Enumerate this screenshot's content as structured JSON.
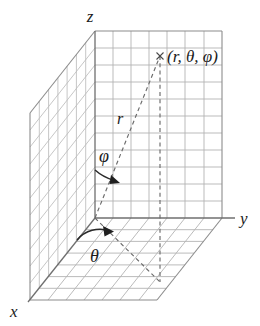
{
  "figure": {
    "background_color": "#ffffff",
    "grid_color": "#b3b3b3",
    "frame_color": "#8c8c8c",
    "axis_color": "#6f6f6f",
    "dashed_color": "#6b6b6b",
    "label_color": "#1b1b1b"
  },
  "axes": [
    {
      "key": "z",
      "label": "z",
      "name": "z-axis-label"
    },
    {
      "key": "y",
      "label": "y",
      "name": "y-axis-label"
    },
    {
      "key": "x",
      "label": "x",
      "name": "x-axis-label"
    }
  ],
  "labels": {
    "z": "z",
    "y": "y",
    "x": "x",
    "radius": "r",
    "polar_angle": "φ",
    "azimuth_angle": "θ",
    "point": "(r, θ, φ)"
  },
  "point": {
    "marker": "×",
    "coordinates_label": "(r, θ, φ)",
    "components": [
      "r",
      "θ",
      "φ"
    ]
  },
  "planes": [
    {
      "name": "back-wall-plane",
      "orientation": "yz",
      "columns": 7,
      "rows": 10
    },
    {
      "name": "left-wall-plane",
      "orientation": "xz",
      "columns": 7,
      "rows": 10
    },
    {
      "name": "floor-plane",
      "orientation": "xy",
      "columns": 7,
      "rows": 7
    }
  ],
  "annotations": [
    {
      "name": "radius-label",
      "text": "r",
      "meaning": "radial distance from origin to point"
    },
    {
      "name": "polar-angle-label",
      "text": "φ",
      "meaning": "angle from positive z-axis"
    },
    {
      "name": "azimuth-angle-label",
      "text": "θ",
      "meaning": "angle in xy-plane from x-axis"
    },
    {
      "name": "point-label",
      "text": "(r, θ, φ)",
      "meaning": "spherical coordinates of the marked point"
    }
  ]
}
